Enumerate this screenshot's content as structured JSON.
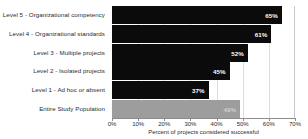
{
  "chart_data": {
    "type": "bar",
    "orientation": "horizontal",
    "title": "",
    "xlabel": "Percent of projects considered successful",
    "ylabel": "",
    "xlim": [
      0,
      70
    ],
    "xticks": [
      "0%",
      "10%",
      "20%",
      "30%",
      "40%",
      "50%",
      "60%",
      "70%"
    ],
    "xtick_values": [
      0,
      10,
      20,
      30,
      40,
      50,
      60,
      70
    ],
    "grid": true,
    "legend": "none",
    "categories": [
      "Level 5 - Organizational competency",
      "Level 4 - Organizational standards",
      "Level 3 - Multiple projects",
      "Level 2 - Isolated projects",
      "Level 1 - Ad hoc or absent",
      "Entire Study Population"
    ],
    "values": [
      65,
      61,
      52,
      45,
      37,
      49
    ],
    "value_labels": [
      "65%",
      "61%",
      "52%",
      "45%",
      "37%",
      "49%"
    ],
    "bar_colors": [
      "#0b0b0b",
      "#0b0b0b",
      "#0b0b0b",
      "#0b0b0b",
      "#0b0b0b",
      "#9d9d9d"
    ],
    "bar_styles": [
      "dark",
      "dark",
      "dark",
      "dark",
      "dark",
      "gray"
    ]
  },
  "colors": {
    "bar_dark": "#0b0b0b",
    "bar_gray": "#9d9d9d",
    "gridline": "#dedede",
    "axis": "#8c8c8c",
    "text": "#2b2b2b",
    "background": "#ffffff"
  }
}
